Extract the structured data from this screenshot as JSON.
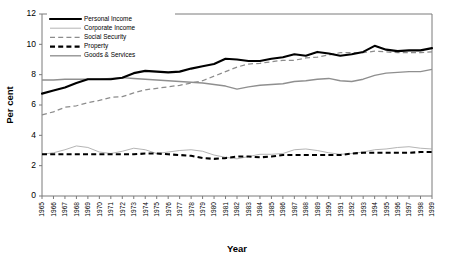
{
  "chart_data": {
    "type": "line",
    "title": "",
    "xlabel": "Year",
    "ylabel": "Per cent",
    "ylim": [
      0,
      12
    ],
    "yticks": [
      0,
      2,
      4,
      6,
      8,
      10,
      12
    ],
    "grid": false,
    "legend_position": "top-left",
    "x": [
      1965,
      1966,
      1967,
      1968,
      1969,
      1970,
      1971,
      1972,
      1973,
      1974,
      1975,
      1976,
      1977,
      1978,
      1979,
      1980,
      1981,
      1982,
      1983,
      1984,
      1985,
      1986,
      1987,
      1988,
      1989,
      1990,
      1991,
      1992,
      1993,
      1994,
      1995,
      1996,
      1997,
      1998,
      1999
    ],
    "xtick_labels": [
      "1965",
      "1966",
      "1967",
      "1968",
      "1969",
      "1970",
      "1971",
      "1972",
      "1973",
      "1974",
      "1975",
      "1976",
      "1977",
      "1978",
      "1979",
      "1980",
      "1981",
      "1982",
      "1983",
      "1984",
      "1985",
      "1986",
      "1987",
      "1988",
      "1989",
      "1990",
      "1991",
      "1992",
      "1993",
      "1994",
      "1995",
      "1996",
      "1997",
      "1998",
      "1999"
    ],
    "series": [
      {
        "name": "Personal Income",
        "style": "thick-solid-black",
        "color": "#000000",
        "values": [
          6.75,
          6.95,
          7.15,
          7.45,
          7.7,
          7.7,
          7.7,
          7.8,
          8.1,
          8.25,
          8.2,
          8.15,
          8.2,
          8.4,
          8.55,
          8.7,
          9.05,
          9.0,
          8.9,
          8.9,
          9.05,
          9.15,
          9.35,
          9.25,
          9.5,
          9.4,
          9.25,
          9.35,
          9.5,
          9.9,
          9.65,
          9.55,
          9.6,
          9.6,
          9.75
        ]
      },
      {
        "name": "Corporate Income",
        "style": "thin-solid-grey",
        "color": "#a6a6a6",
        "values": [
          2.75,
          2.85,
          3.05,
          3.3,
          3.2,
          2.9,
          2.8,
          2.95,
          3.15,
          3.05,
          2.8,
          2.9,
          3.0,
          3.05,
          2.95,
          2.7,
          2.55,
          2.45,
          2.6,
          2.75,
          2.75,
          2.8,
          3.05,
          3.1,
          3.0,
          2.85,
          2.75,
          2.8,
          2.9,
          3.05,
          3.1,
          3.2,
          3.25,
          3.15,
          3.1
        ]
      },
      {
        "name": "Social Security",
        "style": "thin-dashed-grey",
        "color": "#8c8c8c",
        "values": [
          5.35,
          5.55,
          5.85,
          5.95,
          6.15,
          6.3,
          6.5,
          6.55,
          6.8,
          7.0,
          7.1,
          7.2,
          7.3,
          7.45,
          7.6,
          7.9,
          8.2,
          8.5,
          8.7,
          8.75,
          8.85,
          8.95,
          8.95,
          9.1,
          9.15,
          9.3,
          9.45,
          9.45,
          9.45,
          9.55,
          9.5,
          9.45,
          9.45,
          9.45,
          9.5
        ]
      },
      {
        "name": "Property",
        "style": "thick-dashed-black",
        "color": "#000000",
        "values": [
          2.75,
          2.75,
          2.75,
          2.75,
          2.75,
          2.75,
          2.75,
          2.75,
          2.75,
          2.8,
          2.8,
          2.75,
          2.7,
          2.65,
          2.5,
          2.45,
          2.5,
          2.6,
          2.6,
          2.55,
          2.6,
          2.7,
          2.7,
          2.7,
          2.7,
          2.7,
          2.7,
          2.8,
          2.85,
          2.85,
          2.85,
          2.85,
          2.85,
          2.9,
          2.9
        ]
      },
      {
        "name": "Goods & Services",
        "style": "medium-solid-grey",
        "color": "#8f8f8f",
        "values": [
          7.65,
          7.65,
          7.7,
          7.7,
          7.7,
          7.7,
          7.75,
          7.8,
          7.75,
          7.7,
          7.65,
          7.6,
          7.55,
          7.5,
          7.45,
          7.35,
          7.25,
          7.05,
          7.2,
          7.3,
          7.35,
          7.4,
          7.55,
          7.6,
          7.7,
          7.75,
          7.6,
          7.55,
          7.7,
          7.95,
          8.1,
          8.15,
          8.2,
          8.2,
          8.35
        ]
      }
    ],
    "legend": [
      {
        "label": "Personal Income",
        "style": "thick-solid-black"
      },
      {
        "label": "Corporate Income",
        "style": "thin-solid-grey"
      },
      {
        "label": "Social Security",
        "style": "thin-dashed-grey"
      },
      {
        "label": "Property",
        "style": "thick-dashed-black"
      },
      {
        "label": "Goods & Services",
        "style": "medium-solid-grey"
      }
    ]
  }
}
